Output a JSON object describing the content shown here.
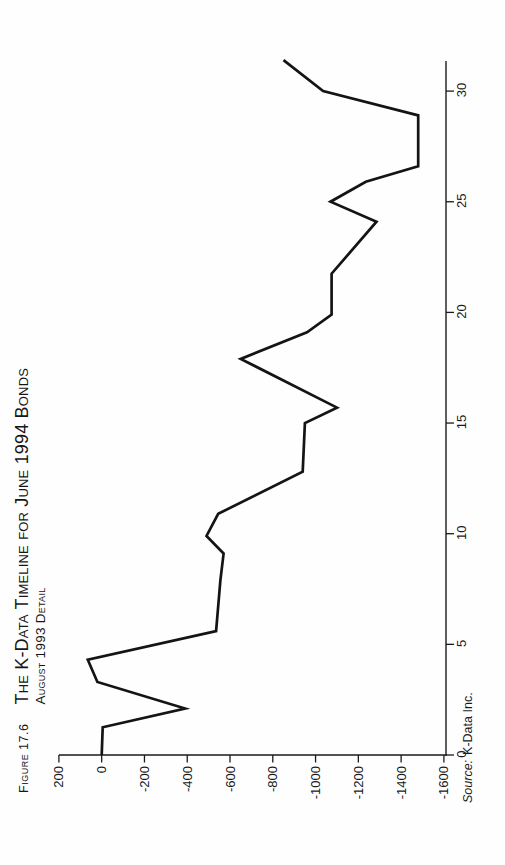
{
  "figure": {
    "number_label": "Figure 17.6",
    "title_line1": "The K-Data Timeline for June 1994 Bonds",
    "title_line2": "August 1993 Detail",
    "source_prefix": "Source:",
    "source_name": "K-Data Inc."
  },
  "colors": {
    "ink": "#1a1a1a",
    "line": "#141414",
    "paper": "#fefefe"
  },
  "chart_data": {
    "type": "line",
    "xlabel": "",
    "ylabel": "",
    "xlim": [
      0,
      31.4
    ],
    "ylim": [
      -1600,
      200
    ],
    "x_ticks": [
      0,
      5,
      10,
      15,
      20,
      25,
      30
    ],
    "y_ticks": [
      200,
      0,
      -200,
      -400,
      -600,
      -800,
      -1000,
      -1200,
      -1400,
      -1600
    ],
    "grid": false,
    "legend": "none",
    "page_rotation_deg": -90,
    "series": [
      {
        "name": "K-Data timeline",
        "points": [
          [
            0,
            0
          ],
          [
            1.25,
            -5
          ],
          [
            2.1,
            -390
          ],
          [
            3.3,
            20
          ],
          [
            4.3,
            65
          ],
          [
            5.6,
            -535
          ],
          [
            7.9,
            -555
          ],
          [
            9.1,
            -570
          ],
          [
            9.9,
            -490
          ],
          [
            10.9,
            -545
          ],
          [
            12.8,
            -940
          ],
          [
            15.0,
            -950
          ],
          [
            15.7,
            -1100
          ],
          [
            17.9,
            -650
          ],
          [
            19.1,
            -960
          ],
          [
            19.9,
            -1075
          ],
          [
            21.75,
            -1075
          ],
          [
            24.1,
            -1285
          ],
          [
            25.0,
            -1070
          ],
          [
            25.9,
            -1235
          ],
          [
            26.6,
            -1480
          ],
          [
            28.9,
            -1480
          ],
          [
            30.0,
            -1035
          ],
          [
            31.4,
            -850
          ]
        ]
      }
    ]
  }
}
